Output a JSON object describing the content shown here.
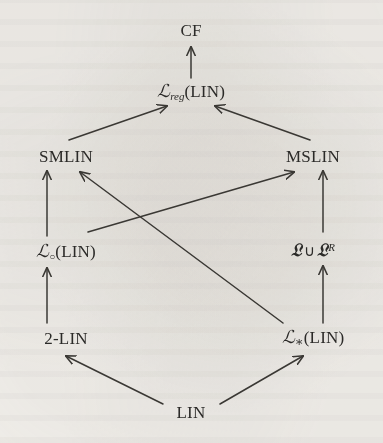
{
  "figure": {
    "type": "hasse-diagram",
    "background_color": "#f4f2ee",
    "ink_color": "#3a3834",
    "width": 383,
    "height": 443
  },
  "nodes": [
    {
      "id": "cf",
      "name": "node-cf",
      "label": "CF",
      "parts": [
        {
          "kind": "plain",
          "text": "CF"
        }
      ],
      "x": 191,
      "y": 30
    },
    {
      "id": "lreg_lin",
      "name": "node-l-reg-lin",
      "label": "ℒ_reg(LIN)",
      "parts": [
        {
          "kind": "cal",
          "text": "ℒ"
        },
        {
          "kind": "sub",
          "text": "reg"
        },
        {
          "kind": "plain",
          "text": "(LIN)"
        }
      ],
      "x": 191,
      "y": 92
    },
    {
      "id": "smlin",
      "name": "node-smlin",
      "label": "SMLIN",
      "parts": [
        {
          "kind": "plain",
          "text": "SMLIN"
        }
      ],
      "x": 66,
      "y": 156
    },
    {
      "id": "mslin",
      "name": "node-mslin",
      "label": "MSLIN",
      "parts": [
        {
          "kind": "plain",
          "text": "MSLIN"
        }
      ],
      "x": 313,
      "y": 156
    },
    {
      "id": "lcirc_lin",
      "name": "node-l-circ-lin",
      "label": "ℒ_∘(LIN)",
      "parts": [
        {
          "kind": "cal",
          "text": "ℒ"
        },
        {
          "kind": "sub-circ",
          "text": "○"
        },
        {
          "kind": "plain",
          "text": "(LIN)"
        }
      ],
      "x": 66,
      "y": 252
    },
    {
      "id": "frak_union",
      "name": "node-frak-l-union-frak-l-r",
      "label": "𝔏 ∪ 𝔏^R",
      "parts": [
        {
          "kind": "frak",
          "text": "𝔏"
        },
        {
          "kind": "op",
          "text": "∪"
        },
        {
          "kind": "frak",
          "text": "𝔏"
        },
        {
          "kind": "sup",
          "text": "R"
        }
      ],
      "x": 313,
      "y": 250
    },
    {
      "id": "two_lin",
      "name": "node-2-lin",
      "label": "2-LIN",
      "parts": [
        {
          "kind": "plain",
          "text": "2-LIN"
        }
      ],
      "x": 66,
      "y": 338
    },
    {
      "id": "lstar_lin",
      "name": "node-l-star-lin",
      "label": "ℒ_*(LIN)",
      "parts": [
        {
          "kind": "cal",
          "text": "ℒ"
        },
        {
          "kind": "sub-star",
          "text": "∗"
        },
        {
          "kind": "plain",
          "text": "(LIN)"
        }
      ],
      "x": 313,
      "y": 338
    },
    {
      "id": "lin",
      "name": "node-lin",
      "label": "LIN",
      "parts": [
        {
          "kind": "plain",
          "text": "LIN"
        }
      ],
      "x": 191,
      "y": 412
    }
  ],
  "edges": [
    {
      "name": "edge-lreg-to-cf",
      "from": "lreg_lin",
      "to": "cf",
      "x1": 191,
      "y1": 78,
      "x2": 191,
      "y2": 47
    },
    {
      "name": "edge-smlin-to-lreg",
      "from": "smlin",
      "to": "lreg_lin",
      "x1": 69,
      "y1": 140,
      "x2": 167,
      "y2": 106
    },
    {
      "name": "edge-mslin-to-lreg",
      "from": "mslin",
      "to": "lreg_lin",
      "x1": 310,
      "y1": 140,
      "x2": 215,
      "y2": 106
    },
    {
      "name": "edge-lcirc-to-smlin",
      "from": "lcirc_lin",
      "to": "smlin",
      "x1": 47,
      "y1": 236,
      "x2": 47,
      "y2": 171
    },
    {
      "name": "edge-lstar-to-smlin",
      "from": "lstar_lin",
      "to": "smlin",
      "x1": 283,
      "y1": 323,
      "x2": 80,
      "y2": 172
    },
    {
      "name": "edge-lcirc-to-mslin",
      "from": "lcirc_lin",
      "to": "mslin",
      "x1": 88,
      "y1": 232,
      "x2": 294,
      "y2": 172
    },
    {
      "name": "edge-frak-to-mslin",
      "from": "frak_union",
      "to": "mslin",
      "x1": 323,
      "y1": 232,
      "x2": 323,
      "y2": 171
    },
    {
      "name": "edge-2lin-to-lcirc",
      "from": "two_lin",
      "to": "lcirc_lin",
      "x1": 47,
      "y1": 323,
      "x2": 47,
      "y2": 268
    },
    {
      "name": "edge-lstar-to-frak",
      "from": "lstar_lin",
      "to": "frak_union",
      "x1": 323,
      "y1": 323,
      "x2": 323,
      "y2": 266
    },
    {
      "name": "edge-lin-to-2lin",
      "from": "lin",
      "to": "two_lin",
      "x1": 163,
      "y1": 404,
      "x2": 66,
      "y2": 356
    },
    {
      "name": "edge-lin-to-lstar",
      "from": "lin",
      "to": "lstar_lin",
      "x1": 220,
      "y1": 404,
      "x2": 303,
      "y2": 356
    }
  ]
}
